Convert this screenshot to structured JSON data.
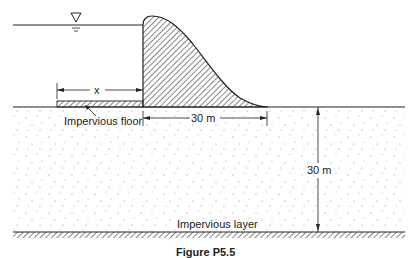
{
  "figure": {
    "labels": {
      "floor_length": "x",
      "impervious_floor": "Impervious floor",
      "dam_base_width": "30 m",
      "layer_depth": "30 m",
      "impervious_layer": "Impervious layer"
    },
    "caption": "Figure P5.5",
    "symbols": {
      "water_level": "water-level-triangle"
    },
    "colors": {
      "line": "#222222",
      "background": "#ffffff",
      "soil_dots": "#8a8a8a"
    }
  }
}
